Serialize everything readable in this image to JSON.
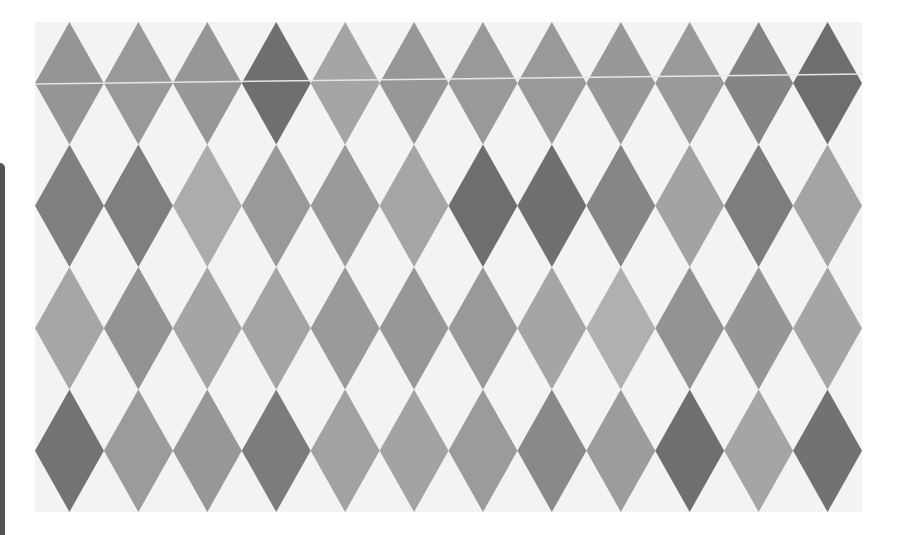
{
  "image": {
    "description": "Harlequin diamond pattern in grayscale tones",
    "background_color": "#f3f3f2",
    "left_bar_color": "#545454",
    "panel": {
      "x": 35,
      "y": 22,
      "width": 827,
      "height": 490
    },
    "grid": {
      "columns": 12,
      "rows": 4
    },
    "seam_line": {
      "color": "#e6e6e6",
      "x1": 0,
      "y1": 62,
      "x2": 827,
      "y2": 52
    },
    "rows": [
      {
        "row": 1,
        "colors": [
          "#959595",
          "#999999",
          "#979797",
          "#6f6f6f",
          "#a5a5a5",
          "#979797",
          "#999999",
          "#999999",
          "#989898",
          "#9a9a9a",
          "#858585",
          "#6e6e6e"
        ]
      },
      {
        "row": 2,
        "colors": [
          "#808080",
          "#7f7f7f",
          "#acacac",
          "#999999",
          "#9a9a9a",
          "#a6a6a6",
          "#6e6e6e",
          "#707070",
          "#868686",
          "#a3a3a3",
          "#7d7d7d",
          "#a4a4a4"
        ]
      },
      {
        "row": 3,
        "colors": [
          "#a6a6a6",
          "#939393",
          "#a5a5a5",
          "#a4a4a4",
          "#9a9a9a",
          "#979797",
          "#999999",
          "#a5a5a5",
          "#b0b0b0",
          "#939393",
          "#969696",
          "#a5a5a5"
        ]
      },
      {
        "row": 4,
        "colors": [
          "#737373",
          "#9b9b9b",
          "#979797",
          "#7c7c7c",
          "#a2a2a2",
          "#a3a3a3",
          "#9b9b9b",
          "#898989",
          "#9c9c9c",
          "#6f6f6f",
          "#a5a5a5",
          "#727272"
        ]
      }
    ]
  }
}
